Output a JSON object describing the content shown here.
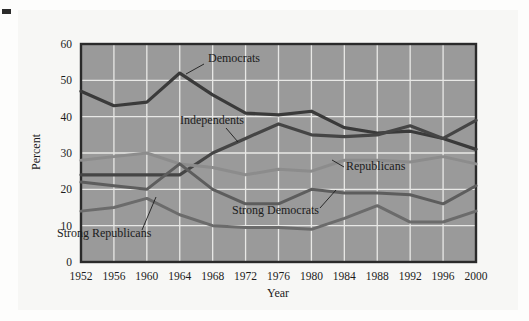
{
  "figure": {
    "background_color": "#f7f7f5",
    "plot_background_color": "#9a9a9a",
    "grid_color": "#e8e8e6",
    "frame_color": "#2a2a2a"
  },
  "chart_data": {
    "type": "line",
    "title": "",
    "xlabel": "Year",
    "ylabel": "Percent",
    "xlim": [
      1952,
      2000
    ],
    "ylim": [
      0,
      60
    ],
    "ytick_labels": [
      "0",
      "10",
      "20",
      "30",
      "40",
      "50",
      "60"
    ],
    "yticks": [
      0,
      10,
      20,
      30,
      40,
      50,
      60
    ],
    "grid": true,
    "legend_position": "inline-annotations",
    "categories": [
      1952,
      1956,
      1960,
      1964,
      1968,
      1972,
      1976,
      1980,
      1984,
      1988,
      1992,
      1996,
      2000
    ],
    "xtick_labels": [
      "1952",
      "1956",
      "1960",
      "1964",
      "1968",
      "1972",
      "1976",
      "1980",
      "1984",
      "1988",
      "1992",
      "1996",
      "2000"
    ],
    "series": [
      {
        "name": "Democrats",
        "color": "#3a3a3a",
        "width": 3.2,
        "values": [
          47,
          43,
          44,
          52,
          46,
          41,
          40.5,
          41.5,
          37,
          35.5,
          36,
          34,
          31
        ]
      },
      {
        "name": "Independents",
        "color": "#454545",
        "width": 3.2,
        "values": [
          24,
          24,
          24,
          24,
          30,
          34,
          38,
          35,
          34.5,
          35,
          37.5,
          34,
          39
        ]
      },
      {
        "name": "Republicans",
        "color": "#8c8c8c",
        "width": 3.0,
        "values": [
          28,
          29,
          30,
          27,
          26,
          24,
          25.5,
          25,
          28,
          28,
          27.5,
          29,
          27
        ]
      },
      {
        "name": "Strong Democrats",
        "color": "#5d5d5d",
        "width": 3.0,
        "values": [
          22,
          21,
          20,
          27,
          20,
          16,
          16,
          20,
          19,
          19,
          18.5,
          16,
          21
        ]
      },
      {
        "name": "Strong Republicans",
        "color": "#6b6b6b",
        "width": 3.0,
        "values": [
          14,
          15,
          17.5,
          13,
          10,
          9.5,
          9.5,
          9,
          12,
          15.5,
          11,
          11,
          14
        ]
      }
    ],
    "annotations": [
      {
        "name": "Democrats",
        "label": "Democrats",
        "text_x": 208,
        "text_y": 62,
        "leader": "M204,64 L186,74"
      },
      {
        "name": "Independents",
        "label": "Independents",
        "text_x": 180,
        "text_y": 124,
        "leader": "M226,128 L238,142"
      },
      {
        "name": "Republicans",
        "label": "Republicans",
        "text_x": 346,
        "text_y": 170,
        "leader": "M344,167 L332,160"
      },
      {
        "name": "Strong Democrats",
        "label": "Strong Democrats",
        "text_x": 232,
        "text_y": 214,
        "leader": "M320,208 L336,190"
      },
      {
        "name": "Strong Republicans",
        "label": "Strong Republicans",
        "text_x": 57,
        "text_y": 237,
        "leader": "M142,230 L156,197"
      }
    ]
  }
}
